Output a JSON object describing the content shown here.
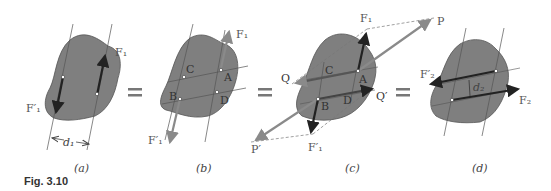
{
  "figure": {
    "caption": "Fig. 3.10",
    "colors": {
      "body_fill": "#7f7f7f",
      "body_stroke": "#555555",
      "force_dark": "#222222",
      "force_gray": "#8a8a8a",
      "line": "#555555",
      "dashed": "#777777"
    },
    "equals_signs": [
      "=",
      "=",
      "="
    ],
    "panels": [
      {
        "id": "a",
        "label": "(a)",
        "forces": [
          "F1",
          "F'1"
        ],
        "labels": {
          "F1": "F₁",
          "F1prime": "F′₁",
          "distance": "d₁"
        }
      },
      {
        "id": "b",
        "label": "(b)",
        "points": [
          "A",
          "B",
          "C",
          "D"
        ],
        "labels": {
          "F1": "F₁",
          "F1prime": "F′₁"
        }
      },
      {
        "id": "c",
        "label": "(c)",
        "points": [
          "A",
          "B",
          "C",
          "D"
        ],
        "labels": {
          "F1": "F₁",
          "F1prime": "F′₁",
          "P": "P",
          "Pprime": "P′",
          "Q": "Q",
          "Qprime": "Q′"
        }
      },
      {
        "id": "d",
        "label": "(d)",
        "labels": {
          "F2": "F₂",
          "F2prime": "F′₂",
          "distance": "d₂"
        }
      }
    ]
  }
}
